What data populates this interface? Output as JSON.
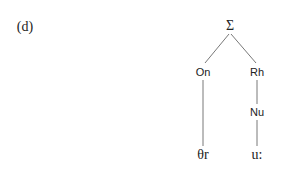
{
  "panel_label": "(d)",
  "tree": {
    "root": {
      "label": "Σ"
    },
    "onset": {
      "label": "On"
    },
    "rhyme": {
      "label": "Rh"
    },
    "nucleus": {
      "label": "Nu"
    },
    "onset_segment": {
      "label": "θr"
    },
    "nucleus_segment": {
      "label": "u:"
    }
  },
  "colors": {
    "line": "#555555",
    "text": "#222222"
  }
}
